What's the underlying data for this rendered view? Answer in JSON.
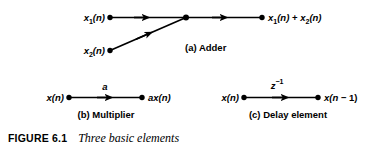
{
  "figure": {
    "caption_number": "FIGURE 6.1",
    "caption_title": "Three basic elements",
    "line_color": "#000000",
    "background_color": "#ffffff"
  },
  "adder": {
    "sub_caption": "(a) Adder",
    "input1_label": "x₁(n)",
    "input2_label": "x₂(n)",
    "output_label": "x₁(n) + x₂(n)"
  },
  "multiplier": {
    "sub_caption": "(b) Multiplier",
    "input_label": "x(n)",
    "gain_label": "a",
    "output_label": "ax(n)"
  },
  "delay": {
    "sub_caption": "(c) Delay element",
    "input_label": "x(n)",
    "operator_label": "z",
    "operator_exponent": "−1",
    "output_label": "x(n − 1)"
  }
}
